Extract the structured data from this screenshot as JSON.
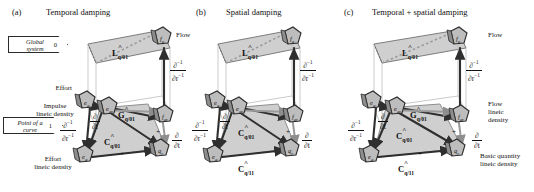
{
  "figure": {
    "caption_type": "three-panel tetrahedron-of-state diagrams",
    "panels": [
      {
        "letter": "(a)",
        "title": "Temporal damping",
        "tags": [
          {
            "text_line1": "Global",
            "text_line2": "system",
            "number": "0"
          },
          {
            "text_line1": "Point of a",
            "text_line2": "curve",
            "number": "1"
          }
        ],
        "side_labels": [
          "Effort",
          "Impulse\nlineic density",
          "Effort\nlineic density",
          "Flow"
        ],
        "nodes": [
          {
            "name": "effort-node-top",
            "symbol": "e",
            "sub": "q"
          },
          {
            "name": "flow-node-top",
            "symbol": "f",
            "sub": "q"
          },
          {
            "name": "effort-node-inner",
            "symbol": "e",
            "sub": "qr"
          },
          {
            "name": "flow-node-inner",
            "symbol": "f",
            "sub": "qr"
          },
          {
            "name": "effort-node-bottom",
            "symbol": "e",
            "sub": "q"
          },
          {
            "name": "quantity-node-bottom",
            "symbol": "q",
            "sub": "r"
          }
        ],
        "operators": [
          {
            "name": "L-operator",
            "letter": "L",
            "sub": "q/01"
          },
          {
            "name": "G-operator",
            "letter": "G",
            "sub": "q/01"
          },
          {
            "name": "C-operator",
            "letter": "C",
            "sub": "q/01"
          }
        ],
        "derivatives": [
          {
            "name": "inverse-space-derivative-left",
            "num": "∂⁻¹",
            "den": "∂r⁻¹"
          },
          {
            "name": "inverse-space-derivative-right",
            "num": "∂⁻¹",
            "den": "∂r⁻¹"
          },
          {
            "name": "time-derivative-left",
            "num": "∂",
            "den": "∂t"
          },
          {
            "name": "time-derivative-right",
            "num": "∂",
            "den": "∂t"
          }
        ],
        "signs": [
          "+",
          "+"
        ]
      },
      {
        "letter": "(b)",
        "title": "Spatial damping",
        "tags": [],
        "side_labels": [],
        "nodes": [
          {
            "name": "effort-node-top",
            "symbol": "e",
            "sub": "q"
          },
          {
            "name": "flow-node-top",
            "symbol": "f",
            "sub": "q"
          },
          {
            "name": "effort-node-inner",
            "symbol": "e",
            "sub": "qr"
          },
          {
            "name": "flow-node-inner",
            "symbol": "f",
            "sub": "qr"
          },
          {
            "name": "effort-node-bottom",
            "symbol": "e",
            "sub": "q"
          },
          {
            "name": "quantity-node-bottom",
            "symbol": "q",
            "sub": "r"
          }
        ],
        "operators": [
          {
            "name": "L-operator",
            "letter": "L",
            "sub": "q/01"
          },
          {
            "name": "C-operator-inner",
            "letter": "C",
            "sub": "q/01"
          },
          {
            "name": "C-operator-outer",
            "letter": "C",
            "sub": "q/11"
          }
        ],
        "derivatives": [
          {
            "name": "inverse-space-derivative-left",
            "num": "∂⁻¹",
            "den": "∂r⁻¹"
          },
          {
            "name": "inverse-space-derivative-right",
            "num": "∂⁻¹",
            "den": "∂r⁻¹"
          },
          {
            "name": "time-derivative-left",
            "num": "∂",
            "den": "∂t"
          },
          {
            "name": "time-derivative-right",
            "num": "∂",
            "den": "∂t"
          }
        ],
        "signs": [
          "+"
        ]
      },
      {
        "letter": "(c)",
        "title": "Temporal + spatial damping",
        "tags": [],
        "side_labels": [
          "Flow",
          "Flow\nlineic\ndensity",
          "Basic quantity\nlineic density"
        ],
        "nodes": [
          {
            "name": "effort-node-top",
            "symbol": "e",
            "sub": "q"
          },
          {
            "name": "flow-node-top",
            "symbol": "f",
            "sub": "q"
          },
          {
            "name": "effort-node-inner",
            "symbol": "e",
            "sub": "qr"
          },
          {
            "name": "flow-node-inner",
            "symbol": "f",
            "sub": "qr"
          },
          {
            "name": "effort-node-bottom",
            "symbol": "e",
            "sub": "q"
          },
          {
            "name": "quantity-node-bottom",
            "symbol": "q",
            "sub": "r"
          }
        ],
        "operators": [
          {
            "name": "L-operator",
            "letter": "L",
            "sub": "q/01"
          },
          {
            "name": "G-operator",
            "letter": "G",
            "sub": "q/01"
          },
          {
            "name": "C-operator-inner",
            "letter": "C",
            "sub": "q/01"
          },
          {
            "name": "C-operator-outer",
            "letter": "C",
            "sub": "q/11"
          }
        ],
        "derivatives": [
          {
            "name": "inverse-space-derivative-left",
            "num": "∂⁻¹",
            "den": "∂r⁻¹"
          },
          {
            "name": "inverse-space-derivative-right",
            "num": "∂⁻¹",
            "den": "∂r⁻¹"
          },
          {
            "name": "time-derivative-left",
            "num": "∂",
            "den": "∂t"
          },
          {
            "name": "time-derivative-right",
            "num": "∂",
            "den": "∂t"
          }
        ],
        "signs": [
          "+",
          "+"
        ]
      }
    ],
    "colors": {
      "face_fill": "#cfcfcf",
      "edge_dark": "#2f2f2f",
      "edge_light": "#9a9a9a",
      "node_fill": "#b8b8b8",
      "node_stroke": "#2b2b2b",
      "background": "#ffffff"
    }
  }
}
